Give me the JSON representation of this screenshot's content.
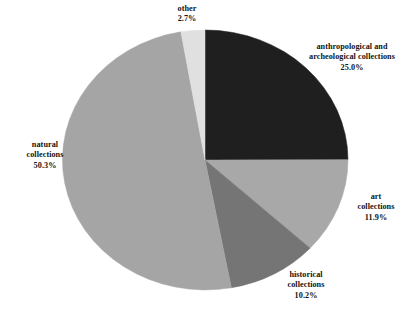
{
  "chart_data": {
    "type": "pie",
    "title": "",
    "xlabel": "",
    "ylabel": "",
    "legend_position": "none",
    "grid": false,
    "labels_outside": true,
    "categories": [
      "anthropological and archeological collections",
      "art collections",
      "historical collections",
      "natural collections",
      "other"
    ],
    "values": [
      25.0,
      11.9,
      10.2,
      50.3,
      2.7
    ],
    "value_suffix": "%",
    "start_angle_deg": 0,
    "direction": "clockwise",
    "slices": [
      {
        "name": "anthropological and archeological collections",
        "name_line1": "anthropological and",
        "name_line2": "archeological collections",
        "value": 25.0,
        "value_label": "25.0%",
        "color": "#1f1f1f"
      },
      {
        "name": "art collections",
        "name_line1": "art",
        "name_line2": "collections",
        "value": 11.9,
        "value_label": "11.9%",
        "color": "#a8a8a8"
      },
      {
        "name": "historical collections",
        "name_line1": "historical",
        "name_line2": "collections",
        "value": 10.2,
        "value_label": "10.2%",
        "color": "#757575"
      },
      {
        "name": "natural collections",
        "name_line1": "natural",
        "name_line2": "collections",
        "value": 50.3,
        "value_label": "50.3%",
        "color": "#a5a5a5"
      },
      {
        "name": "other",
        "name_line1": "other",
        "name_line2": "",
        "value": 2.7,
        "value_label": "2.7%",
        "color": "#e0e0e0"
      }
    ]
  },
  "figure": {
    "background_color": "#ffffff",
    "text_color": "#141414",
    "title_remnant": ""
  }
}
